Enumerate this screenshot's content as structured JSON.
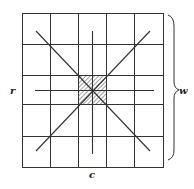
{
  "diagram": {
    "grid": {
      "rows": 5,
      "cols": 5
    },
    "shaded_cell": {
      "row": 2,
      "col": 2,
      "pattern": "diagonal-hatch"
    },
    "lines": [
      "diagonal-main",
      "diagonal-anti",
      "center-vertical",
      "center-horizontal"
    ],
    "labels": {
      "left": "r",
      "bottom": "c",
      "right": "w"
    },
    "brace": {
      "side": "right",
      "spans": "full-height"
    },
    "colors": {
      "stroke": "#333333",
      "background": "#ffffff"
    }
  }
}
